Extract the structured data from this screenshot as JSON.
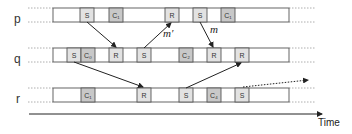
{
  "diagram": {
    "type": "process-timeline",
    "processes": [
      {
        "id": "p",
        "label": "p",
        "y": 8,
        "boxes": [
          {
            "label": "S",
            "x": 80,
            "kind": "send"
          },
          {
            "label": "C₁",
            "x": 109,
            "kind": "checkpoint"
          },
          {
            "label": "R",
            "x": 165,
            "kind": "receive"
          },
          {
            "label": "S",
            "x": 193,
            "kind": "send"
          },
          {
            "label": "C₁",
            "x": 221,
            "kind": "checkpoint"
          }
        ]
      },
      {
        "id": "q",
        "label": "q",
        "y": 48,
        "boxes": [
          {
            "label": "S",
            "x": 67,
            "kind": "send"
          },
          {
            "label": "C₀",
            "x": 81,
            "kind": "checkpoint"
          },
          {
            "label": "R",
            "x": 109,
            "kind": "receive"
          },
          {
            "label": "S",
            "x": 137,
            "kind": "send"
          },
          {
            "label": "C₂",
            "x": 165,
            "kind": "checkpoint"
          },
          {
            "label": "R",
            "x": 207,
            "kind": "receive"
          },
          {
            "label": "R",
            "x": 235,
            "kind": "receive"
          }
        ]
      },
      {
        "id": "r",
        "label": "r",
        "y": 88,
        "boxes": [
          {
            "label": "C₁",
            "x": 81,
            "kind": "checkpoint"
          },
          {
            "label": "R",
            "x": 137,
            "kind": "receive"
          },
          {
            "label": "S",
            "x": 179,
            "kind": "send"
          },
          {
            "label": "C₄",
            "x": 207,
            "kind": "checkpoint"
          },
          {
            "label": "S",
            "x": 235,
            "kind": "send"
          }
        ]
      }
    ],
    "messages": [
      {
        "from": "p",
        "to": "q",
        "label": "",
        "x1": 87,
        "y1": 22,
        "x2": 116,
        "y2": 48
      },
      {
        "from": "q",
        "to": "p",
        "label": "m′",
        "x1": 144,
        "y1": 48,
        "x2": 172,
        "y2": 22
      },
      {
        "from": "p",
        "to": "q",
        "label": "m",
        "x1": 200,
        "y1": 22,
        "x2": 214,
        "y2": 48
      },
      {
        "from": "q",
        "to": "r",
        "label": "",
        "x1": 74,
        "y1": 62,
        "x2": 144,
        "y2": 88
      },
      {
        "from": "r",
        "to": "q",
        "label": "",
        "x1": 186,
        "y1": 88,
        "x2": 242,
        "y2": 62
      },
      {
        "from": "r",
        "to": "out",
        "label": "",
        "x1": 243,
        "y1": 88,
        "x2": 310,
        "y2": 80,
        "dotted": true
      }
    ],
    "time_axis": {
      "label": "Time"
    },
    "colors": {
      "send_receive_fill": "#e2e2e2",
      "checkpoint_fill": "#c8c8c8",
      "bar_stroke": "#555555",
      "arrow": "#222222"
    }
  }
}
